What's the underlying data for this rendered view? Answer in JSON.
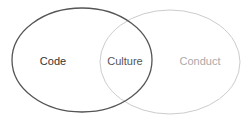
{
  "diagram": {
    "type": "venn",
    "sets": [
      {
        "id": "code",
        "label": "Code",
        "stroke": "#555555",
        "text_color": "#333333"
      },
      {
        "id": "conduct",
        "label": "Conduct",
        "stroke": "#cccccc",
        "text_color": "#aaaaaa"
      }
    ],
    "intersection": {
      "label": "Culture",
      "text_color": "#555555"
    }
  }
}
